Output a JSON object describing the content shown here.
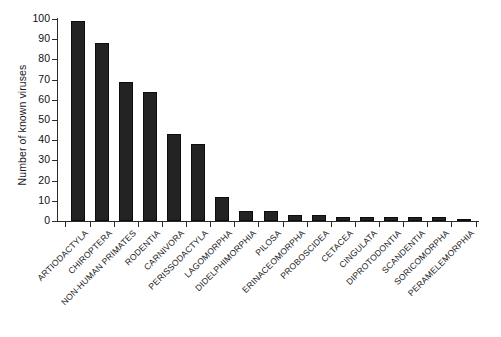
{
  "chart_data": {
    "type": "bar",
    "title": "",
    "xlabel": "",
    "ylabel": "Number of known viruses",
    "ylim": [
      0,
      100
    ],
    "yticks": [
      0,
      10,
      20,
      30,
      40,
      50,
      60,
      70,
      80,
      90,
      100
    ],
    "grid": false,
    "legend": null,
    "bar_color": "#232323",
    "axis_color": "#2b2b2b",
    "background_color": "#ffffff",
    "x_tick_label_rotation": 45,
    "categories": [
      "ARTIODACTYLA",
      "CHIROPTERA",
      "NON-HUMAN PRIMATES",
      "RODENTIA",
      "CARNIVORA",
      "PERISSODACTYLA",
      "LAGOMORPHA",
      "DIDELPHIMORPHIA",
      "PILOSA",
      "ERINACEOMORPHA",
      "PROBOSCIDEA",
      "CETACEA",
      "CINGULATA",
      "DIPROTODONTIA",
      "SCANDENTIA",
      "SORICOMORPHA",
      "PERAMELEMORPHIA"
    ],
    "values": [
      99,
      88,
      69,
      64,
      43,
      38,
      12,
      5,
      5,
      3,
      3,
      2,
      2,
      2,
      2,
      2,
      1
    ]
  }
}
